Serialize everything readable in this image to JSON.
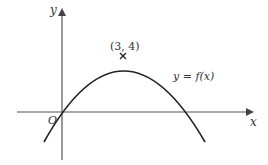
{
  "diagram": {
    "type": "function-graph",
    "axes": {
      "x_label": "x",
      "y_label": "y",
      "origin_label": "O"
    },
    "curve": {
      "label": "y = f(x)",
      "shape": "downward parabola through origin",
      "maximum_point": {
        "x": 3,
        "y": 4,
        "label": "(3, 4)",
        "marker": "×"
      }
    },
    "colors": {
      "axes": "#555555",
      "curve": "#222222",
      "text": "#333333",
      "background": "#ffffff"
    }
  }
}
